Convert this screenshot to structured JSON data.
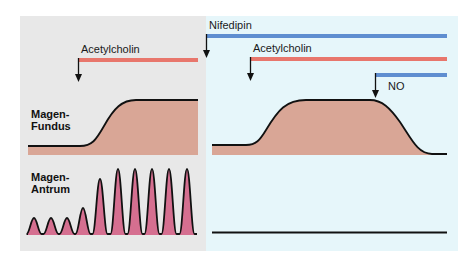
{
  "colors": {
    "left_panel_bg": "#e8e8e8",
    "right_panel_bg": "#e6f6fa",
    "fundus_fill": "#d9a696",
    "antrum_fill": "#d56f90",
    "acetylcholin_bar": "#e8766c",
    "nifedipin_bar": "#5f8ed0",
    "no_bar": "#5f8ed0",
    "line": "#111111"
  },
  "labels": {
    "fundus": [
      "Magen-",
      "Fundus"
    ],
    "antrum": [
      "Magen-",
      "Antrum"
    ]
  },
  "left_panel": {
    "stimuli": [
      {
        "name": "Acetylcholin",
        "label": "Acetylcholin"
      }
    ]
  },
  "right_panel": {
    "stimuli": [
      {
        "name": "Nifedipin",
        "label": "Nifedipin"
      },
      {
        "name": "Acetylcholin",
        "label": "Acetylcholin"
      },
      {
        "name": "NO",
        "label": "NO"
      }
    ]
  },
  "antrum_peaks_left": [
    {
      "x": 34,
      "height": 16
    },
    {
      "x": 51,
      "height": 16
    },
    {
      "x": 67,
      "height": 16
    },
    {
      "x": 83,
      "height": 26
    },
    {
      "x": 100,
      "height": 55
    },
    {
      "x": 118,
      "height": 65
    },
    {
      "x": 135,
      "height": 65
    },
    {
      "x": 152,
      "height": 65
    },
    {
      "x": 169,
      "height": 65
    },
    {
      "x": 187,
      "height": 65
    }
  ]
}
